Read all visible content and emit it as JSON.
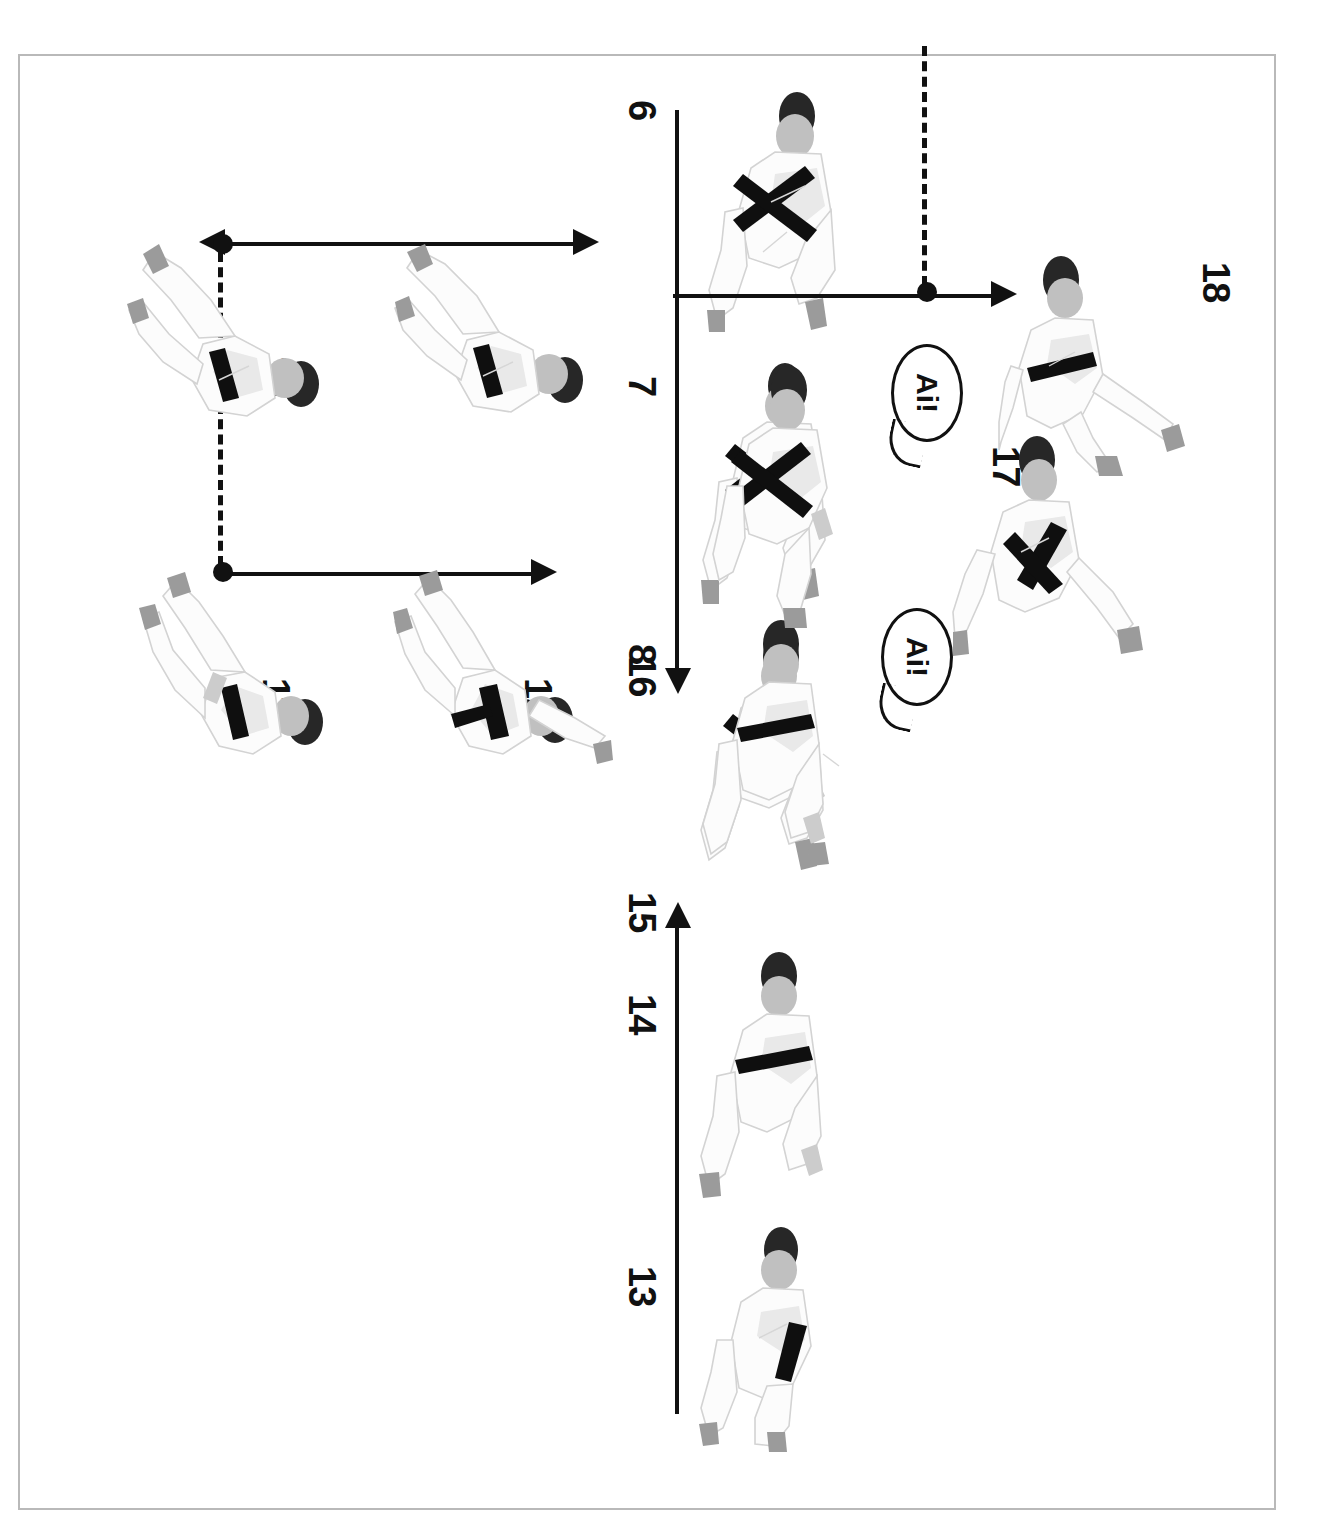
{
  "document": {
    "kind": "scanned-book-page",
    "orientation_note": "page content rotated 90 degrees counter-clockwise within the scan",
    "page_number_cut": "..",
    "background_color": "#ffffff",
    "frame_color": "#b9b9b9",
    "ink_color": "#111111"
  },
  "sequence": {
    "title": "",
    "steps": [
      {
        "id": "6",
        "label": "6"
      },
      {
        "id": "7",
        "label": "7"
      },
      {
        "id": "8",
        "label": "8"
      },
      {
        "id": "9",
        "label": "9"
      },
      {
        "id": "10",
        "label": "10"
      },
      {
        "id": "11",
        "label": "11"
      },
      {
        "id": "12",
        "label": "12"
      },
      {
        "id": "13",
        "label": "13"
      },
      {
        "id": "14",
        "label": "14"
      },
      {
        "id": "15",
        "label": "15"
      },
      {
        "id": "16",
        "label": "16"
      },
      {
        "id": "17",
        "label": "17"
      },
      {
        "id": "18",
        "label": "18"
      }
    ]
  },
  "callouts": [
    {
      "id": "callout-a",
      "text": "Ai!",
      "near_step": "8"
    },
    {
      "id": "callout-b",
      "text": "Ai!",
      "near_step": "16"
    }
  ],
  "annotations": {
    "arrows": [
      {
        "id": "arrow-6-8-run",
        "direction": "right",
        "style": "solid",
        "note": "long horizontal arrow under steps 6-8"
      },
      {
        "id": "arrow-10-drop",
        "direction": "down",
        "style": "solid",
        "note": "vertical arrow at step 10"
      },
      {
        "id": "arrow-9-rise",
        "direction": "up",
        "style": "solid",
        "note": "vertical arrow at step 9"
      },
      {
        "id": "arrow-11-12-rise",
        "direction": "up",
        "style": "solid",
        "note": "vertical arrow spanning steps 11-12"
      },
      {
        "id": "arrow-13-15-run",
        "direction": "left",
        "style": "solid",
        "note": "long horizontal arrow under steps 13-15"
      },
      {
        "id": "arrow-16-18-rise",
        "direction": "up",
        "style": "solid",
        "note": "vertical arrow spanning steps 16-18"
      }
    ],
    "dashed_guides": [
      {
        "id": "guide-9-11",
        "style": "dashed",
        "endpoints": "two filled dots",
        "note": "horizontal dashed guide between step 9 and step 11 foot positions"
      },
      {
        "id": "guide-17-18",
        "style": "dashed",
        "endpoints": "one filled dot",
        "note": "horizontal dashed guide at step 17/18 foot height"
      }
    ],
    "dot_color": "#111111",
    "line_color": "#111111"
  }
}
